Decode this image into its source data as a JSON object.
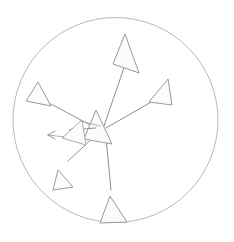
{
  "figure": {
    "title": "",
    "width": 234,
    "height": 242,
    "background_color": "#ffffff"
  },
  "chart_data": {
    "type": "scatter",
    "title": "",
    "subtitle": "",
    "xlabel": "",
    "ylabel": "",
    "grid": false,
    "legend_position": "none",
    "xlim": [
      13,
      218
    ],
    "ylim": [
      12,
      228
    ],
    "boundary": {
      "shape": "circle",
      "center_x": 115.5,
      "center_y": 120,
      "radius": 102.5,
      "stroke_color": "#b9b9b9",
      "fill": "none"
    },
    "origin": {
      "x": 100,
      "y": 128,
      "label": ""
    },
    "glyph_style": {
      "shaft_color": "#8f8f8f",
      "head_fill": "#fbfbfb",
      "head_stroke": "#9a9a9a"
    },
    "series": [
      {
        "name": "vectors",
        "values": [
          {
            "id": "vector-north",
            "direction_deg": 77,
            "magnitude": 96,
            "tail_x": 104,
            "tail_y": 126,
            "tip_x": 125,
            "tip_y": 34,
            "head_length": 28,
            "head_width": 22
          },
          {
            "id": "vector-east",
            "direction_deg": 27,
            "magnitude": 70,
            "tail_x": 106,
            "tail_y": 128,
            "tip_x": 168,
            "tip_y": 79,
            "head_length": 23,
            "head_width": 19
          },
          {
            "id": "vector-northwest",
            "direction_deg": 152,
            "magnitude": 68,
            "tail_x": 92,
            "tail_y": 126,
            "tip_x": 38,
            "tip_y": 82,
            "head_length": 25,
            "head_width": 21
          },
          {
            "id": "vector-southwest",
            "direction_deg": 234,
            "magnitude": 62,
            "tail_x": 96,
            "tail_y": 135,
            "tip_x": 58,
            "tip_y": 170,
            "head_length": 25,
            "head_width": 19
          },
          {
            "id": "vector-south",
            "direction_deg": 272,
            "magnitude": 72,
            "tail_x": 106,
            "tail_y": 138,
            "tip_x": 110,
            "tip_y": 196,
            "head_length": 28,
            "head_width": 22
          },
          {
            "id": "vector-west-major",
            "direction_deg": 186,
            "magnitude": 42,
            "tail_x": 100,
            "tail_y": 128,
            "tip_x": 68,
            "tip_y": 131,
            "head_length": 22,
            "head_width": 17
          },
          {
            "id": "vector-west-minor",
            "direction_deg": 182,
            "magnitude": 30,
            "tail_x": 78,
            "tail_y": 133,
            "tip_x": 48,
            "tip_y": 134,
            "head_length": 7,
            "head_width": 7
          }
        ]
      }
    ],
    "annotations": [],
    "tick_labels": {
      "x": [],
      "y": []
    }
  }
}
